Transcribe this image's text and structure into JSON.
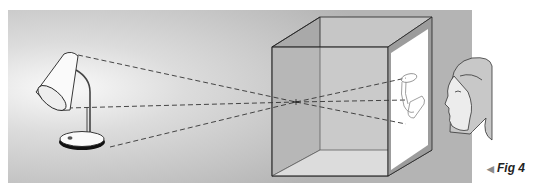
{
  "figure": {
    "caption_arrow": "◀",
    "caption_label": "Fig 4",
    "top_mark": "'",
    "colors": {
      "background_light": "#f2f2f2",
      "background_dark": "#b9b9b9",
      "box_left_wall": "#a6a6a6",
      "box_back_wall": "#c4c4c4",
      "box_floor": "#e0e0e0",
      "box_top": "#bcbcbc",
      "screen_frame": "#9a9a9a",
      "screen": "#ffffff",
      "lines": "#333333"
    },
    "elements": [
      "desk-lamp",
      "light-rays",
      "camera-obscura-box",
      "pinhole",
      "projected-inverted-image",
      "viewer-face"
    ]
  }
}
